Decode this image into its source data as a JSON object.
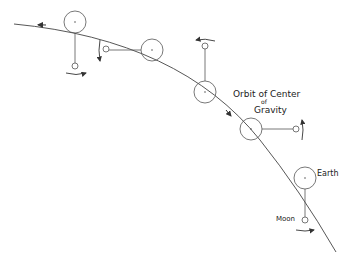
{
  "diagram": {
    "labels": {
      "orbit_line1": "Orbit of Center",
      "orbit_line2": "of",
      "orbit_line3": "Gravity",
      "earth": "Earth",
      "moon": "Moon"
    },
    "stroke_color": "#333333",
    "background": "#ffffff"
  }
}
